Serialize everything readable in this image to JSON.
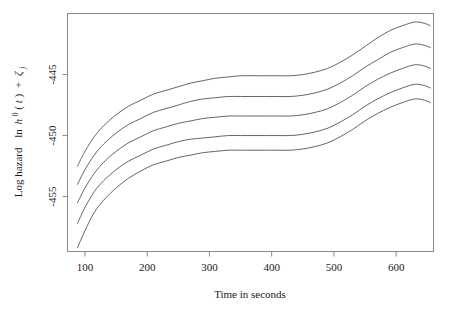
{
  "chart_data": {
    "type": "line",
    "title": "",
    "subtitle": "",
    "xlabel": "Time in seconds",
    "ylabel": "Log hazard  ln h0(t) + zeta_j",
    "ylabel_parts": {
      "prefix": "Log hazard",
      "ln": "ln",
      "h": "h",
      "h_sup": "0",
      "t_paren_open": "(",
      "t": "t",
      "t_paren_close": ")",
      "plus": "+",
      "zeta": "ζ",
      "zeta_sub": "j"
    },
    "xlim": [
      72,
      660
    ],
    "ylim": [
      -459.5,
      -440.0
    ],
    "xticks": [
      100,
      200,
      300,
      400,
      500,
      600
    ],
    "xticklabels": [
      "100",
      "200",
      "300",
      "400",
      "500",
      "600"
    ],
    "yticks": [
      -445,
      -450,
      -455
    ],
    "yticklabels": [
      "-445",
      "-450",
      "-455"
    ],
    "grid": false,
    "legend": false,
    "legend_position": "none",
    "line_color": "#555555",
    "frame_color": "#8a8a8a",
    "background_color": "#ffffff",
    "x": [
      88,
      100,
      115,
      130,
      150,
      170,
      190,
      210,
      230,
      250,
      270,
      290,
      310,
      330,
      350,
      370,
      390,
      410,
      430,
      450,
      470,
      490,
      510,
      530,
      550,
      570,
      590,
      610,
      630,
      645,
      655
    ],
    "series": [
      {
        "name": "curve-1",
        "values": [
          -452.5,
          -451.3,
          -450.1,
          -449.2,
          -448.3,
          -447.6,
          -447.1,
          -446.6,
          -446.3,
          -446.0,
          -445.7,
          -445.5,
          -445.3,
          -445.2,
          -445.1,
          -445.1,
          -445.1,
          -445.1,
          -445.1,
          -445.0,
          -444.8,
          -444.5,
          -444.0,
          -443.4,
          -442.7,
          -442.0,
          -441.4,
          -441.0,
          -440.7,
          -440.8,
          -441.0
        ]
      },
      {
        "name": "curve-2",
        "values": [
          -454.0,
          -452.8,
          -451.6,
          -450.7,
          -449.8,
          -449.1,
          -448.6,
          -448.1,
          -447.8,
          -447.5,
          -447.2,
          -447.0,
          -446.9,
          -446.8,
          -446.8,
          -446.8,
          -446.8,
          -446.8,
          -446.8,
          -446.7,
          -446.5,
          -446.2,
          -445.7,
          -445.1,
          -444.4,
          -443.8,
          -443.2,
          -442.8,
          -442.5,
          -442.6,
          -442.8
        ]
      },
      {
        "name": "curve-3",
        "values": [
          -455.5,
          -454.3,
          -453.1,
          -452.2,
          -451.3,
          -450.6,
          -450.1,
          -449.6,
          -449.3,
          -449.0,
          -448.8,
          -448.6,
          -448.5,
          -448.4,
          -448.4,
          -448.4,
          -448.4,
          -448.4,
          -448.4,
          -448.3,
          -448.1,
          -447.8,
          -447.3,
          -446.7,
          -446.0,
          -445.4,
          -444.9,
          -444.5,
          -444.2,
          -444.3,
          -444.5
        ]
      },
      {
        "name": "curve-4",
        "values": [
          -457.2,
          -455.9,
          -454.6,
          -453.7,
          -452.8,
          -452.1,
          -451.6,
          -451.1,
          -450.8,
          -450.5,
          -450.3,
          -450.2,
          -450.1,
          -450.0,
          -450.0,
          -450.0,
          -450.0,
          -450.0,
          -450.0,
          -449.9,
          -449.7,
          -449.4,
          -448.9,
          -448.3,
          -447.6,
          -447.0,
          -446.5,
          -446.1,
          -445.8,
          -445.9,
          -446.1
        ]
      },
      {
        "name": "curve-5",
        "values": [
          -459.2,
          -457.8,
          -456.3,
          -455.3,
          -454.3,
          -453.5,
          -452.9,
          -452.4,
          -452.1,
          -451.8,
          -451.6,
          -451.4,
          -451.3,
          -451.2,
          -451.2,
          -451.2,
          -451.2,
          -451.2,
          -451.2,
          -451.1,
          -450.9,
          -450.6,
          -450.1,
          -449.5,
          -448.8,
          -448.2,
          -447.7,
          -447.3,
          -447.0,
          -447.1,
          -447.3
        ]
      }
    ]
  }
}
